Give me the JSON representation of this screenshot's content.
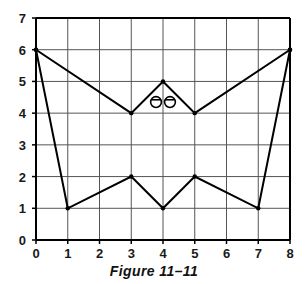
{
  "figure": {
    "caption": "Figure 11–11",
    "background_color": "#ffffff",
    "axis_color": "#000000",
    "grid_color": "#555555",
    "stroke_color": "#000000"
  },
  "chart_data": {
    "type": "line",
    "title": "Figure 11–11",
    "xlabel": "",
    "ylabel": "",
    "xlim": [
      0,
      8
    ],
    "ylim": [
      0,
      7
    ],
    "grid": true,
    "legend": "none",
    "x_ticks": [
      0,
      1,
      2,
      3,
      4,
      5,
      6,
      7,
      8
    ],
    "y_ticks": [
      0,
      1,
      2,
      3,
      4,
      5,
      6,
      7
    ],
    "x_tick_labels": [
      "0",
      "1",
      "2",
      "3",
      "4",
      "5",
      "6",
      "7",
      "8"
    ],
    "y_tick_labels": [
      "0",
      "1",
      "2",
      "3",
      "4",
      "5",
      "6",
      "7"
    ],
    "series": [
      {
        "name": "upper-outline",
        "closed": false,
        "markers": true,
        "points": [
          {
            "x": 0,
            "y": 6
          },
          {
            "x": 3,
            "y": 4
          },
          {
            "x": 4,
            "y": 5
          },
          {
            "x": 5,
            "y": 4
          },
          {
            "x": 8,
            "y": 6
          }
        ]
      },
      {
        "name": "lower-outline",
        "closed": false,
        "markers": true,
        "points": [
          {
            "x": 0,
            "y": 6
          },
          {
            "x": 1,
            "y": 1
          },
          {
            "x": 3,
            "y": 2
          },
          {
            "x": 4,
            "y": 1
          },
          {
            "x": 5,
            "y": 2
          },
          {
            "x": 7,
            "y": 1
          },
          {
            "x": 8,
            "y": 6
          }
        ]
      }
    ],
    "annotations": [
      {
        "name": "eye-left",
        "shape": "circle-with-chord",
        "x": 3.78,
        "y": 4.35,
        "r": 0.17
      },
      {
        "name": "eye-right",
        "shape": "circle-with-chord",
        "x": 4.22,
        "y": 4.35,
        "r": 0.17
      }
    ]
  }
}
